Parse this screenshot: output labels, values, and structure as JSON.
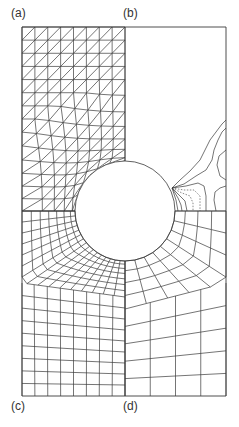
{
  "figure": {
    "width": 239,
    "height": 427,
    "line_color": "#3a3a3a",
    "background": "#ffffff",
    "frame": {
      "x0": 22,
      "y0": 27,
      "x1": 226,
      "y1": 396
    },
    "center_x": 125,
    "hole": {
      "cx": 125,
      "cy": 211,
      "r": 50
    },
    "labels": [
      {
        "id": "a",
        "text": "(a)",
        "x": 11,
        "y": 7
      },
      {
        "id": "b",
        "text": "(b)",
        "x": 123,
        "y": 7
      },
      {
        "id": "c",
        "text": "(c)",
        "x": 11,
        "y": 400
      },
      {
        "id": "d",
        "text": "(d)",
        "x": 123,
        "y": 400
      }
    ]
  },
  "panels": {
    "a": {
      "description": "Triangulated mesh, upper-left quadrant",
      "columns": 8,
      "rows": 9,
      "diagonal": "bottom-left to top-right"
    },
    "b": {
      "description": "Contour lines near hole, upper-right quadrant",
      "contour_origin": {
        "x": 172,
        "y": 188
      }
    },
    "c": {
      "description": "Fine quadrilateral mesh, lower-left quadrant",
      "columns": 8,
      "radial_rings": 7,
      "rect_rows": 9
    },
    "d": {
      "description": "Coarse quadrilateral mesh, lower-right quadrant",
      "columns": 4,
      "radial_rings": 4,
      "rect_rows": 4
    }
  }
}
